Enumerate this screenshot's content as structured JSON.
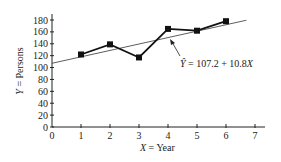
{
  "chart_data": {
    "type": "line",
    "title": "",
    "xlabel": "X = Year",
    "ylabel": "Y = Persons",
    "x": [
      1,
      2,
      3,
      4,
      5,
      6
    ],
    "series": [
      {
        "name": "Observed",
        "values": [
          122,
          139,
          117,
          165,
          162,
          178
        ],
        "marker": "square"
      }
    ],
    "regression": {
      "intercept": 107.2,
      "slope": 10.8,
      "label": "Ŷ = 107.2 + 10.8X",
      "x_range": [
        0,
        6.7
      ]
    },
    "xticks": [
      "0",
      "1",
      "2",
      "3",
      "4",
      "5",
      "6",
      "7"
    ],
    "yticks": [
      "0",
      "20",
      "40",
      "60",
      "80",
      "100",
      "120",
      "140",
      "160",
      "180"
    ],
    "xlim": [
      0,
      7.4
    ],
    "ylim": [
      0,
      185
    ],
    "grid": false,
    "legend": "none"
  },
  "labels": {
    "xlabel_var": "X",
    "xlabel_text": " = Year",
    "ylabel_var": "Y",
    "ylabel_text": " = Persons",
    "annotation_yhat": "Ŷ",
    "annotation_eq": " = 107.2 + 10.8",
    "annotation_x": "X"
  }
}
